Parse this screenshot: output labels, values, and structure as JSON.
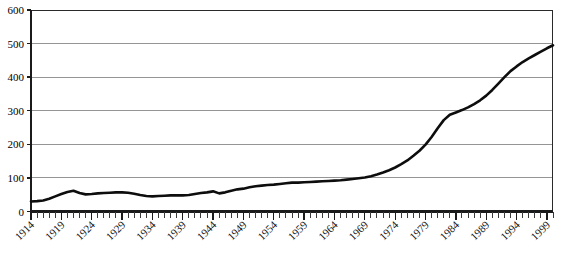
{
  "chart_data": {
    "type": "line",
    "title": "",
    "subtitle": "",
    "xlabel": "",
    "ylabel": "",
    "xlim": [
      1914,
      2000
    ],
    "ylim": [
      0,
      600
    ],
    "grid": true,
    "legend": false,
    "legend_position": "none",
    "y_ticks": [
      0,
      100,
      200,
      300,
      400,
      500,
      600
    ],
    "y_tick_labels": [
      "0",
      "100",
      "200",
      "300",
      "400",
      "500",
      "600"
    ],
    "x_tick_labels": [
      "1914",
      "1919",
      "1924",
      "1929",
      "1934",
      "1939",
      "1944",
      "1949",
      "1954",
      "1959",
      "1964",
      "1969",
      "1974",
      "1979",
      "1984",
      "1989",
      "1994",
      "1999"
    ],
    "x_tick_values": [
      1914,
      1919,
      1924,
      1929,
      1934,
      1939,
      1944,
      1949,
      1954,
      1959,
      1964,
      1969,
      1974,
      1979,
      1984,
      1989,
      1994,
      1999
    ],
    "x_minor_tick_step": 1,
    "series": [
      {
        "name": "series-1",
        "color": "#0d0d0d",
        "x": [
          1914,
          1915,
          1916,
          1917,
          1918,
          1919,
          1920,
          1921,
          1922,
          1923,
          1924,
          1925,
          1926,
          1927,
          1928,
          1929,
          1930,
          1931,
          1932,
          1933,
          1934,
          1935,
          1936,
          1937,
          1938,
          1939,
          1940,
          1941,
          1942,
          1943,
          1944,
          1945,
          1946,
          1947,
          1948,
          1949,
          1950,
          1951,
          1952,
          1953,
          1954,
          1955,
          1956,
          1957,
          1958,
          1959,
          1960,
          1961,
          1962,
          1963,
          1964,
          1965,
          1966,
          1967,
          1968,
          1969,
          1970,
          1971,
          1972,
          1973,
          1974,
          1975,
          1976,
          1977,
          1978,
          1979,
          1980,
          1981,
          1982,
          1983,
          1984,
          1985,
          1986,
          1987,
          1988,
          1989,
          1990,
          1991,
          1992,
          1993,
          1994,
          1995,
          1996,
          1997,
          1998,
          1999,
          2000
        ],
        "values": [
          30,
          31,
          33,
          38,
          45,
          52,
          58,
          62,
          55,
          51,
          52,
          54,
          55,
          56,
          57,
          57,
          56,
          53,
          49,
          46,
          45,
          46,
          47,
          48,
          48,
          48,
          49,
          52,
          55,
          57,
          60,
          54,
          57,
          62,
          66,
          68,
          72,
          75,
          77,
          79,
          80,
          82,
          84,
          86,
          86,
          87,
          88,
          89,
          90,
          91,
          92,
          93,
          95,
          97,
          99,
          101,
          105,
          110,
          116,
          123,
          131,
          141,
          152,
          166,
          181,
          199,
          222,
          248,
          272,
          288,
          295,
          302,
          310,
          320,
          331,
          345,
          362,
          381,
          400,
          418,
          432,
          445,
          456,
          466,
          476,
          486,
          495
        ]
      }
    ]
  },
  "axes": {
    "y_axis_name": "value-axis",
    "x_axis_name": "year-axis"
  }
}
